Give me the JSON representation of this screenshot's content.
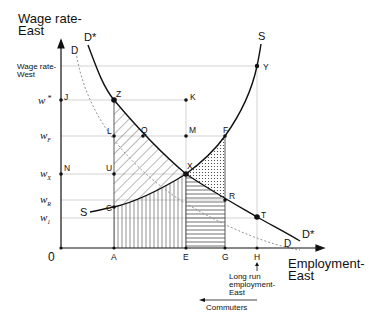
{
  "axes": {
    "y_label_line1": "Wage rate-",
    "y_label_line2": "East",
    "x_label_line1": "Employment-",
    "x_label_line2": "East",
    "origin": "0"
  },
  "wage_levels": {
    "west_line1": "Wage rate-",
    "west_line2": "West",
    "w_star": "w",
    "w_star_sup": "*",
    "w_F": "w",
    "w_F_sub": "F",
    "w_X": "w",
    "w_X_sub": "X",
    "w_R": "w",
    "w_R_sub": "R",
    "w_1": "w",
    "w_1_sub": "1"
  },
  "curves": {
    "D_star_top": "D*",
    "D_star_bottom": "D*",
    "D_top": "D",
    "D_bottom": "D",
    "S_top": "S",
    "S_left": "S"
  },
  "points": {
    "J": "J",
    "Z": "Z",
    "K": "K",
    "L": "L",
    "Q": "Q",
    "M": "M",
    "F": "F",
    "N": "N",
    "U": "U",
    "X": "X",
    "R": "R",
    "C": "C",
    "T": "T",
    "Y": "Y"
  },
  "x_ticks": {
    "A": "A",
    "E": "E",
    "G": "G",
    "H": "H"
  },
  "annotations": {
    "long_run_line1": "Long  run",
    "long_run_line2": "employment-",
    "long_run_line3": "East",
    "commuters": "Commuters"
  },
  "colors": {
    "ink": "#111111",
    "guide": "#c8c8c8",
    "dotted_curve": "#888888"
  }
}
